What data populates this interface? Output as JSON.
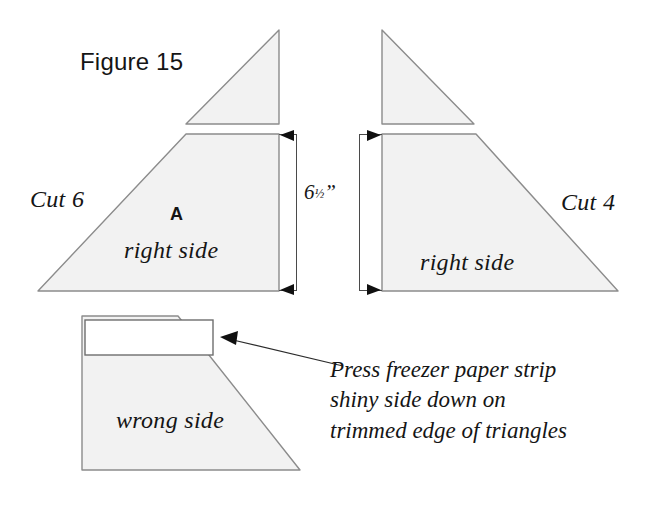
{
  "figure": {
    "title": "Figure 15",
    "background_color": "#ffffff",
    "fabric_fill": "#f2f2f2",
    "outline_color": "#8c8c8c",
    "ink_color": "#151515"
  },
  "labels": {
    "cut_left": "Cut 6",
    "cut_right": "Cut 4",
    "piece_letter": "A",
    "right_side_left": "right side",
    "right_side_right": "right side",
    "wrong_side": "wrong side"
  },
  "dimension": {
    "value": "6",
    "fraction": "½",
    "unit": "”",
    "full": "6½”"
  },
  "callout": {
    "text": "Press freezer paper strip\nshiny side down on\ntrimmed edge of triangles"
  }
}
